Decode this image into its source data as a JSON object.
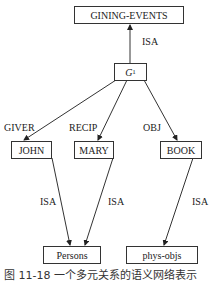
{
  "diagram": {
    "type": "semantic-network",
    "nodes": {
      "event_class": "GINING-EVENTS",
      "event_instance": {
        "base": "G",
        "sub": "1"
      },
      "john": "JOHN",
      "mary": "MARY",
      "book": "BOOK",
      "persons": "Persons",
      "phys_objs": "phys-objs"
    },
    "edges": {
      "g1_isa": "ISA",
      "giver": "GIVER",
      "recip": "RECIP",
      "obj": "OBJ",
      "john_isa": "ISA",
      "mary_isa": "ISA",
      "book_isa": "ISA"
    },
    "caption": "图 11-18   一个多元关系的语义网络表示"
  }
}
